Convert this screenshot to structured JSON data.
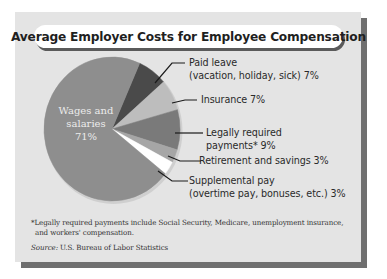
{
  "title": "Average Employer Costs for Employee Compensation",
  "chart_data": {
    "type": "pie",
    "title": "Average Employer Costs for Employee Compensation",
    "categories": [
      "Wages and salaries",
      "Paid leave (vacation, holiday, sick)",
      "Insurance",
      "Legally required payments*",
      "Retirement and savings",
      "Supplemental pay (overtime pay, bonuses, etc.)"
    ],
    "values": [
      71,
      7,
      7,
      9,
      3,
      3
    ],
    "unit": "%",
    "colors": [
      "#8e8e8e",
      "#4a4a4a",
      "#bdbdbd",
      "#7a7a7a",
      "#a6a6a6",
      "#ffffff"
    ],
    "legend": "none (direct labels with leader lines)"
  },
  "labels": {
    "wages_line1": "Wages and",
    "wages_line2": "salaries",
    "wages_pct": "71%",
    "paid_leave_line1": "Paid leave",
    "paid_leave_line2": "(vacation, holiday, sick) 7%",
    "insurance": "Insurance 7%",
    "legal_line1": "Legally required",
    "legal_line2": "payments* 9%",
    "retirement": "Retirement and savings 3%",
    "supplemental_line1": "Supplemental pay",
    "supplemental_line2": "(overtime pay, bonuses, etc.) 3%"
  },
  "footnote": {
    "line1": "*Legally required payments include Social Security, Medicare, unemployment insurance,",
    "line2": "and workers' compensation."
  },
  "source": {
    "label": "Source:",
    "text": " U.S. Bureau of Labor Statistics"
  }
}
